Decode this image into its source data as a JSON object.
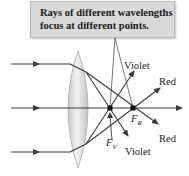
{
  "callout": {
    "line1": "Rays of different wavelengths",
    "line2": "focus at different points."
  },
  "labels": {
    "violet_top": "Violet",
    "red_top": "Red",
    "red_bottom": "Red",
    "violet_bottom": "Violet",
    "focal_red": "F",
    "focal_red_sub": "R",
    "focal_violet": "F",
    "focal_violet_sub": "V"
  },
  "colors": {
    "ray": "#3a3a3a",
    "lens_fill": "#d6d6d6",
    "callout_bg": "#d9d9d9",
    "focal_point": "#111111"
  },
  "geometry": {
    "incident_rays_y": [
      64,
      108,
      152
    ],
    "lens_center_x": 78,
    "focal_violet_point": [
      110,
      108
    ],
    "focal_red_point": [
      133,
      108
    ]
  }
}
